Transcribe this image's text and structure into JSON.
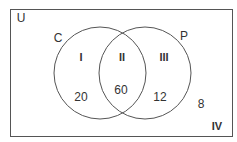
{
  "diagram": {
    "universe_label": "U",
    "sets": [
      {
        "label": "C"
      },
      {
        "label": "P"
      }
    ],
    "regions": [
      {
        "id": "I",
        "label": "I",
        "value": "20"
      },
      {
        "id": "II",
        "label": "II",
        "value": "60"
      },
      {
        "id": "III",
        "label": "III",
        "value": "12"
      },
      {
        "id": "IV",
        "label": "IV",
        "value": "8"
      }
    ],
    "colors": {
      "stroke": "#555555",
      "text": "#333333",
      "background": "#ffffff"
    }
  }
}
